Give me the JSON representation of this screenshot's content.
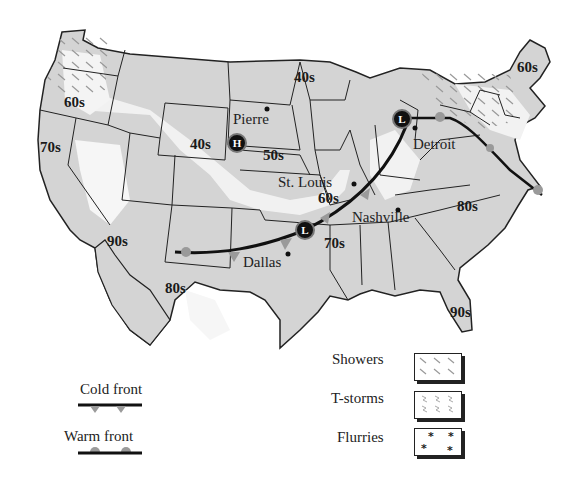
{
  "map": {
    "title": "U.S. Weather Map",
    "temperature_labels": [
      {
        "text": "60s",
        "region": "Northwest"
      },
      {
        "text": "70s",
        "region": "California"
      },
      {
        "text": "90s",
        "region": "Arizona"
      },
      {
        "text": "80s",
        "region": "Texas / Mexico"
      },
      {
        "text": "40s",
        "region": "Wyoming"
      },
      {
        "text": "50s",
        "region": "Nebraska"
      },
      {
        "text": "40s",
        "region": "Minnesota / North Dakota"
      },
      {
        "text": "60s",
        "region": "Missouri"
      },
      {
        "text": "70s",
        "region": "Arkansas"
      },
      {
        "text": "80s",
        "region": "North Carolina"
      },
      {
        "text": "90s",
        "region": "Florida"
      },
      {
        "text": "60s",
        "region": "Maine"
      }
    ],
    "cities": [
      {
        "name": "Pierre"
      },
      {
        "name": "St. Louis"
      },
      {
        "name": "Nashville"
      },
      {
        "name": "Dallas"
      },
      {
        "name": "Detroit"
      }
    ],
    "pressure_systems": [
      {
        "type": "High",
        "symbol": "H",
        "location": "Nebraska / Wyoming border"
      },
      {
        "type": "Low",
        "symbol": "L",
        "location": "Michigan"
      },
      {
        "type": "Low",
        "symbol": "L",
        "location": "Oklahoma / Arkansas"
      }
    ]
  },
  "legend": {
    "fronts": [
      {
        "label": "Cold front",
        "symbol": "triangles"
      },
      {
        "label": "Warm front",
        "symbol": "semicircles"
      }
    ],
    "precipitation": [
      {
        "label": "Showers",
        "pattern": "diagonal-dashes"
      },
      {
        "label": "T-storms",
        "pattern": "lightning-marks"
      },
      {
        "label": "Flurries",
        "pattern": "asterisks"
      }
    ]
  },
  "colors": {
    "land_gray": "#d4d4d4",
    "land_light": "#f2f2f2",
    "front_marker": "#9a9a9a",
    "border": "#222222"
  }
}
